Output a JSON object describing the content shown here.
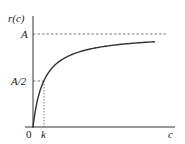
{
  "chart_data": {
    "type": "line",
    "title": "",
    "xlabel": "c",
    "ylabel": "r(c)",
    "x_ticks": [
      "0",
      "k"
    ],
    "y_ticks": [
      "A",
      "A/2"
    ],
    "series": [
      {
        "name": "r(c) = A c / (k + c)",
        "x": [
          0,
          0.25,
          0.5,
          1,
          2,
          3,
          4,
          6,
          8,
          10
        ],
        "values": [
          0,
          0.2,
          0.333,
          0.5,
          0.667,
          0.75,
          0.8,
          0.857,
          0.889,
          0.909
        ]
      }
    ],
    "annotations": [
      {
        "type": "hline-dashed",
        "label": "A",
        "y": 1.0
      },
      {
        "type": "hline-dashed",
        "label": "A/2",
        "y": 0.5,
        "to_x": "k"
      },
      {
        "type": "vline-dotted",
        "label": "k",
        "x": 1,
        "to_y": "A/2"
      }
    ],
    "grid": false,
    "legend": "none"
  },
  "labels": {
    "y_axis": "r(c)",
    "x_axis": "c",
    "origin": "0",
    "k": "k",
    "A": "A",
    "A_half": "A/2"
  },
  "colors": {
    "axis": "#333333",
    "curve": "#333333",
    "dash": "#555555"
  }
}
